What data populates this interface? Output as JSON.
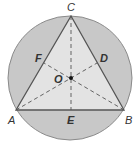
{
  "diagram": {
    "colors": {
      "circle_fill": "#c8c8c8",
      "circle_stroke": "#8a8a8a",
      "triangle_fill": "#e3e3e3",
      "triangle_stroke": "#555555",
      "median_stroke": "#555555",
      "label": "#333333"
    },
    "circle": {
      "cx": 70,
      "cy": 78,
      "r": 62
    },
    "vertices": {
      "A": {
        "label": "A",
        "x": 16,
        "y": 110,
        "lx": 8,
        "ly": 124
      },
      "B": {
        "label": "B",
        "x": 124,
        "y": 110,
        "lx": 125,
        "ly": 124
      },
      "C": {
        "label": "C",
        "x": 71,
        "y": 16,
        "lx": 67,
        "ly": 11
      }
    },
    "midpoints": {
      "D": {
        "label": "D",
        "x": 97,
        "y": 63,
        "lx": 100,
        "ly": 62
      },
      "E": {
        "label": "E",
        "x": 71,
        "y": 110,
        "lx": 67,
        "ly": 124
      },
      "F": {
        "label": "F",
        "x": 44,
        "y": 63,
        "lx": 35,
        "ly": 62
      }
    },
    "center": {
      "label": "O",
      "x": 71,
      "y": 78,
      "lx": 54,
      "ly": 83
    }
  }
}
